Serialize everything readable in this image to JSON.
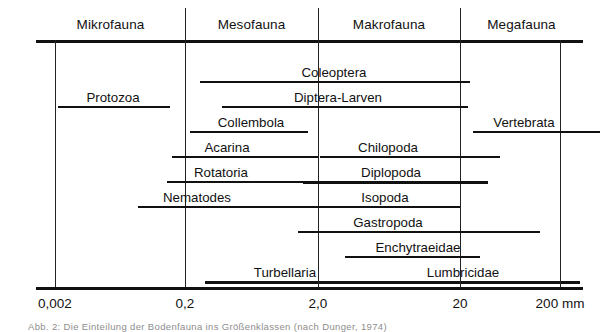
{
  "figure": {
    "caption": "Abb. 2: Die Einteilung der Bodenfauna ins Größenklassen (nach Dunger, 1974)"
  },
  "axis": {
    "unit_suffix": "mm",
    "ticks": [
      {
        "label": "0,002",
        "x": 55
      },
      {
        "label": "0,2",
        "x": 185
      },
      {
        "label": "2,0",
        "x": 318
      },
      {
        "label": "20",
        "x": 460
      },
      {
        "label": "200 mm",
        "x": 560
      }
    ]
  },
  "categories": [
    {
      "label": "Mikrofauna",
      "start": 36,
      "end": 185
    },
    {
      "label": "Mesofauna",
      "start": 185,
      "end": 318
    },
    {
      "label": "Makrofauna",
      "start": 318,
      "end": 460
    },
    {
      "label": "Megafauna",
      "start": 460,
      "end": 583
    }
  ],
  "taxa": [
    {
      "label": "Coleoptera",
      "label_x": 334,
      "bar_start": 200,
      "bar_end": 470,
      "thick": false,
      "row": 0
    },
    {
      "label": "Protozoa",
      "label_x": 113,
      "bar_start": 58,
      "bar_end": 170,
      "thick": false,
      "row": 1
    },
    {
      "label": "Diptera-Larven",
      "label_x": 338,
      "bar_start": 222,
      "bar_end": 468,
      "thick": false,
      "row": 1
    },
    {
      "label": "Collembola",
      "label_x": 251,
      "bar_start": 190,
      "bar_end": 308,
      "thick": false,
      "row": 2
    },
    {
      "label": "Vertebrata",
      "label_x": 524,
      "bar_start": 473,
      "bar_end": 600,
      "thick": false,
      "row": 2
    },
    {
      "label": "Acarina",
      "label_x": 227,
      "bar_start": 172,
      "bar_end": 318,
      "thick": false,
      "row": 3
    },
    {
      "label": "Chilopoda",
      "label_x": 388,
      "bar_start": 320,
      "bar_end": 500,
      "thick": false,
      "row": 3
    },
    {
      "label": "Rotatoria",
      "label_x": 221,
      "bar_start": 167,
      "bar_end": 315,
      "thick": false,
      "row": 4
    },
    {
      "label": "Diplopoda",
      "label_x": 391,
      "bar_start": 303,
      "bar_end": 488,
      "thick": true,
      "row": 4
    },
    {
      "label": "Nematodes",
      "label_x": 197,
      "bar_start": 138,
      "bar_end": 325,
      "thick": false,
      "row": 5
    },
    {
      "label": "Isopoda",
      "label_x": 385,
      "bar_start": 324,
      "bar_end": 460,
      "thick": false,
      "row": 5
    },
    {
      "label": "Gastropoda",
      "label_x": 388,
      "bar_start": 298,
      "bar_end": 540,
      "thick": false,
      "row": 6
    },
    {
      "label": "Enchytraeidae",
      "label_x": 418,
      "bar_start": 345,
      "bar_end": 480,
      "thick": false,
      "row": 7
    },
    {
      "label": "Turbellaria",
      "label_x": 285,
      "bar_start": 205,
      "bar_end": 460,
      "thick": true,
      "row": 8
    },
    {
      "label": "Lumbricidae",
      "label_x": 463,
      "bar_start": 412,
      "bar_end": 580,
      "thick": true,
      "row": 8
    }
  ],
  "layout": {
    "header_label_y": 18,
    "top_rule_y": 40,
    "bottom_rule_y": 287,
    "axis_left": 36,
    "axis_right": 583,
    "row_origin_y": 62,
    "row_height": 25,
    "label_offset": 4,
    "bar_offset": 19
  }
}
